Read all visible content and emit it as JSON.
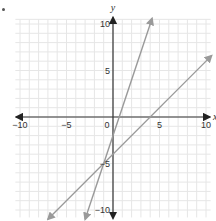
{
  "marker": "•",
  "chart_data": {
    "type": "line",
    "title": "",
    "xlabel": "x",
    "ylabel": "y",
    "xlim": [
      -10.5,
      10.5
    ],
    "ylim": [
      -10.8,
      10.8
    ],
    "grid": true,
    "grid_step": 1,
    "x_ticks": [
      {
        "value": -10,
        "label": "-10"
      },
      {
        "value": -5,
        "label": "-5"
      },
      {
        "value": 0,
        "label": "0"
      },
      {
        "value": 5,
        "label": "5"
      },
      {
        "value": 10,
        "label": "10"
      }
    ],
    "y_ticks": [
      {
        "value": 10,
        "label": "10"
      },
      {
        "value": 5,
        "label": "5"
      },
      {
        "value": -5,
        "label": "-5"
      },
      {
        "value": -10,
        "label": "-10"
      }
    ],
    "series": [
      {
        "name": "y = 3x - 2",
        "slope": 3,
        "intercept": -2,
        "x": [
          -3.0,
          4.2
        ],
        "y": [
          -11.0,
          10.6
        ],
        "color": "#9a9a9a",
        "arrows": "both"
      },
      {
        "name": "y = x - 4",
        "slope": 1,
        "intercept": -4,
        "x": [
          -7.0,
          10.6
        ],
        "y": [
          -11.0,
          6.6
        ],
        "color": "#9a9a9a",
        "arrows": "both"
      }
    ],
    "annotations": [
      {
        "type": "intersection",
        "x": -1,
        "y": -5
      }
    ]
  },
  "colors": {
    "axis": "#333333",
    "grid": "#e6e6e6",
    "line": "#9a9a9a"
  }
}
